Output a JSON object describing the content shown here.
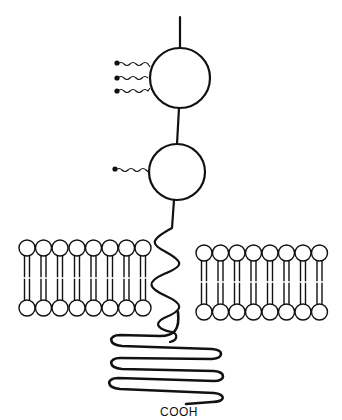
{
  "diagram": {
    "labels": {
      "c_terminus": "COOH"
    },
    "elements": {
      "n_terminal_chain": "polypeptide chain (extracellular)",
      "domain_1": {
        "name": "globular domain 1",
        "attached_chains": 3
      },
      "domain_2": {
        "name": "globular domain 2",
        "attached_chains": 1
      },
      "membrane_segment": "transmembrane helix",
      "cytoplasmic_tail": "coiled cytoplasmic tail",
      "lipid_bilayer_left": {
        "phospholipids": 8
      },
      "lipid_bilayer_right": {
        "phospholipids": 8
      }
    },
    "colors": {
      "stroke": "#111111",
      "background": "#ffffff"
    }
  }
}
